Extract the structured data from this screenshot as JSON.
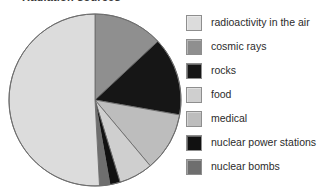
{
  "chart_data": {
    "type": "pie",
    "title": "Radiation sources",
    "xlabel": "",
    "ylabel": "",
    "legend_position": "right",
    "grid": false,
    "start_angle_deg": 0,
    "direction": "clockwise",
    "categories": [
      "radioactivity in the air",
      "cosmic rays",
      "rocks",
      "food",
      "medical",
      "nuclear power stations",
      "nuclear bombs"
    ],
    "values": [
      51,
      13,
      15,
      6,
      11,
      2,
      2
    ],
    "colors": [
      "#dcdcdc",
      "#8f8f8f",
      "#161616",
      "#cfcfcf",
      "#bdbdbd",
      "#111111",
      "#6e6e6e"
    ],
    "draw_order": [
      {
        "name": "cosmic rays",
        "value": 13,
        "start_deg": 0,
        "end_deg": 47,
        "color": "#8f8f8f"
      },
      {
        "name": "rocks",
        "value": 15,
        "start_deg": 47,
        "end_deg": 100,
        "color": "#161616"
      },
      {
        "name": "medical",
        "value": 11,
        "start_deg": 100,
        "end_deg": 140,
        "color": "#bdbdbd"
      },
      {
        "name": "food",
        "value": 6,
        "start_deg": 140,
        "end_deg": 163,
        "color": "#cfcfcf"
      },
      {
        "name": "nuclear power stations",
        "value": 2,
        "start_deg": 163,
        "end_deg": 170,
        "color": "#111111"
      },
      {
        "name": "nuclear bombs",
        "value": 2,
        "start_deg": 170,
        "end_deg": 177,
        "color": "#6e6e6e"
      },
      {
        "name": "radioactivity in the air",
        "value": 51,
        "start_deg": 177,
        "end_deg": 360,
        "color": "#dcdcdc"
      }
    ],
    "geometry": {
      "cx": 87,
      "cy": 87,
      "r": 86
    },
    "stroke_color": "#6d6d6d"
  },
  "legend": {
    "items": [
      {
        "label": "radioactivity in the air",
        "color": "#dcdcdc"
      },
      {
        "label": "cosmic rays",
        "color": "#8f8f8f"
      },
      {
        "label": "rocks",
        "color": "#161616"
      },
      {
        "label": "food",
        "color": "#cfcfcf"
      },
      {
        "label": "medical",
        "color": "#bdbdbd"
      },
      {
        "label": "nuclear power stations",
        "color": "#111111"
      },
      {
        "label": "nuclear bombs",
        "color": "#6e6e6e"
      }
    ]
  }
}
